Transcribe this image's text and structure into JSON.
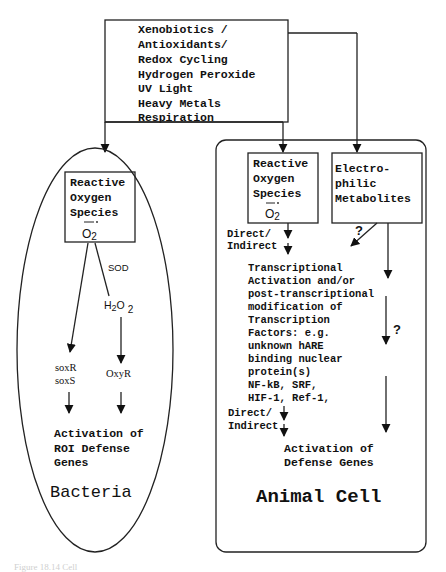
{
  "stimuli": {
    "lines": [
      "Xenobiotics /",
      "Antioxidants/",
      "Redox Cycling",
      "Hydrogen Peroxide",
      "UV Light",
      "Heavy Metals",
      "Respiration"
    ]
  },
  "bacteria": {
    "title": "Bacteria",
    "ros_box": {
      "lines": [
        "Reactive",
        "Oxygen",
        "Species"
      ],
      "radical": "O2"
    },
    "sod_label": "SOD",
    "h2o2_label": {
      "h": "H",
      "sub1": "2",
      "o": "O",
      "sub2": "2"
    },
    "soxrs": [
      "soxR",
      "soxS"
    ],
    "oxyr": "OxyR",
    "outcome": [
      "Activation of",
      "ROI Defense",
      "Genes"
    ]
  },
  "animal_cell": {
    "title": "Animal Cell",
    "ros_box": {
      "lines": [
        "Reactive",
        "Oxygen",
        "Species"
      ],
      "radical": "O2"
    },
    "electrophilic_box": {
      "lines": [
        "Electro-",
        "philic",
        "Metabolites"
      ]
    },
    "direct_indirect_1": [
      "Direct/",
      "Indirect"
    ],
    "question_1": "?",
    "question_2": "?",
    "transcription": [
      "Transcriptional",
      "Activation and/or",
      "post-transcriptional",
      "modification of",
      "Transcription",
      "Factors: e.g.",
      "unknown hARE",
      "binding nuclear",
      "protein(s)",
      "NF-kB, SRF,",
      "HIF-1, Ref-1,"
    ],
    "direct_indirect_2": [
      "Direct/",
      "Indirect"
    ],
    "outcome": [
      "Activation of",
      "Defense Genes"
    ]
  },
  "caption": "Figure 18.14  Cell"
}
